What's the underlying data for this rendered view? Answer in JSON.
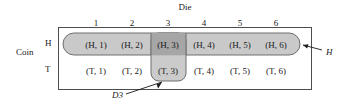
{
  "diagram": {
    "title_axis_top": "Die",
    "title_axis_left": "Coin",
    "die_values": [
      "1",
      "2",
      "3",
      "4",
      "5",
      "6"
    ],
    "coin_values": [
      "H",
      "T"
    ],
    "cells": {
      "H": [
        "(H, 1)",
        "(H, 2)",
        "(H, 3)",
        "(H, 4)",
        "(H, 5)",
        "(H, 6)"
      ],
      "T": [
        "(T, 1)",
        "(T, 2)",
        "(T, 3)",
        "(T, 4)",
        "(T, 5)",
        "(T, 6)"
      ]
    },
    "callouts": {
      "event_h": "H",
      "event_d3": "D3"
    },
    "colors": {
      "outline": "#4d4d4d",
      "event_h_fill": "#c9c9c9",
      "event_d3_fill": "#c2c2c2",
      "intersection_fill": "#a6a6a6",
      "background": "#ffffff"
    }
  }
}
